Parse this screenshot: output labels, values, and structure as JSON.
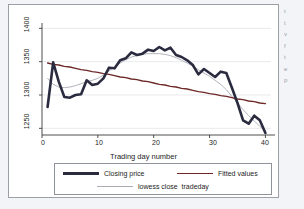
{
  "figure": {
    "background_color": "#ffffff",
    "page_background_color": "#f2f4f7",
    "border_color": "#9aa0a6"
  },
  "margin_text": {
    "line1": "t",
    "line2": "t",
    "line3": "v",
    "line4": "f",
    "line5": "t",
    "line6": "e",
    "line7": "p"
  },
  "chart_data": {
    "type": "line",
    "title": "",
    "subtitle": "",
    "xlabel": "Trading day number",
    "ylabel": "",
    "xlim": [
      0,
      41
    ],
    "ylim": [
      1240,
      1405
    ],
    "xticks": [
      0,
      10,
      20,
      30,
      40
    ],
    "xtick_labels": [
      "0",
      "10",
      "20",
      "30",
      "40"
    ],
    "yticks": [
      1250,
      1300,
      1350,
      1400
    ],
    "ytick_labels": [
      "1250",
      "1300",
      "1350",
      "1400"
    ],
    "grid": true,
    "grid_axis": "y",
    "legend_position": "below",
    "x": [
      1,
      2,
      3,
      4,
      5,
      6,
      7,
      8,
      9,
      10,
      11,
      12,
      13,
      14,
      15,
      16,
      17,
      18,
      19,
      20,
      21,
      22,
      23,
      24,
      25,
      26,
      27,
      28,
      29,
      30,
      31,
      32,
      33,
      34,
      35,
      36,
      37,
      38,
      39,
      40
    ],
    "series": [
      {
        "name": "Closing price",
        "color": "#2b2b40",
        "width": 2.6,
        "values": [
          1282,
          1349,
          1320,
          1297,
          1296,
          1300,
          1301,
          1322,
          1315,
          1317,
          1325,
          1341,
          1340,
          1352,
          1355,
          1364,
          1360,
          1362,
          1368,
          1366,
          1372,
          1367,
          1371,
          1360,
          1357,
          1352,
          1345,
          1331,
          1339,
          1333,
          1327,
          1335,
          1333,
          1311,
          1288,
          1262,
          1257,
          1269,
          1262,
          1243
        ]
      },
      {
        "name": "Fitted values",
        "color": "#6e2828",
        "width": 1.4,
        "values": [
          1348,
          1346,
          1345,
          1343,
          1342,
          1340,
          1338,
          1337,
          1335,
          1334,
          1332,
          1331,
          1329,
          1327,
          1326,
          1324,
          1323,
          1321,
          1320,
          1318,
          1316,
          1315,
          1313,
          1312,
          1310,
          1309,
          1307,
          1305,
          1304,
          1302,
          1301,
          1299,
          1298,
          1296,
          1294,
          1293,
          1291,
          1290,
          1288,
          1287
        ]
      },
      {
        "name": "lowess close  tradeday",
        "color": "#a9aab4",
        "width": 0.9,
        "values": [
          1325,
          1316,
          1312,
          1311,
          1312,
          1314,
          1317,
          1320,
          1322,
          1325,
          1330,
          1336,
          1342,
          1348,
          1353,
          1357,
          1359,
          1361,
          1362,
          1362,
          1362,
          1361,
          1359,
          1356,
          1352,
          1348,
          1343,
          1338,
          1333,
          1328,
          1322,
          1316,
          1308,
          1298,
          1288,
          1278,
          1269,
          1261,
          1253,
          1246
        ]
      }
    ]
  },
  "legend": {
    "closing_price": "Closing price",
    "fitted_values": "Fitted values",
    "lowess": "lowess close  tradeday"
  }
}
